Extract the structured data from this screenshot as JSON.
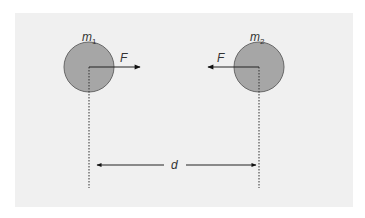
{
  "diagram": {
    "background_color": "#f0f0f0",
    "mass_color": "#a6a6a6",
    "masses": [
      {
        "label_base": "m",
        "label_sub": "1",
        "force_label": "F",
        "force_direction": "right"
      },
      {
        "label_base": "m",
        "label_sub": "2",
        "force_label": "F",
        "force_direction": "left"
      }
    ],
    "distance_label": "d"
  }
}
